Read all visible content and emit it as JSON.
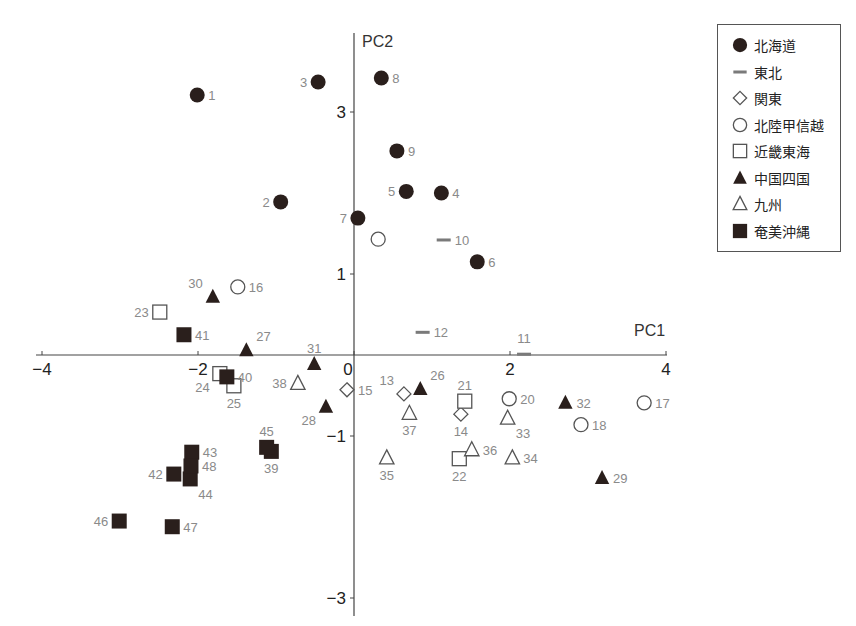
{
  "chart_data": {
    "type": "scatter",
    "title": "",
    "xlabel": "PC1",
    "ylabel": "PC2",
    "xlim": [
      -4,
      4
    ],
    "ylim": [
      -3.2,
      3.8
    ],
    "xticks": [
      -4,
      -2,
      0,
      2,
      4
    ],
    "yticks": [
      3,
      1,
      -1,
      -3
    ],
    "xtick_labels": [
      "−4",
      "−2",
      "0",
      "2",
      "4"
    ],
    "ytick_labels": [
      "3",
      "1",
      "−1",
      "−3"
    ],
    "grid": false,
    "legend_position": "upper right (outside)",
    "series": [
      {
        "name": "北海道",
        "marker": "filled-circle",
        "points": [
          {
            "id": "1",
            "x": -2.01,
            "y": 3.21,
            "label_pos": "right"
          },
          {
            "id": "2",
            "x": -0.94,
            "y": 1.89,
            "label_pos": "left"
          },
          {
            "id": "3",
            "x": -0.46,
            "y": 3.37,
            "label_pos": "left"
          },
          {
            "id": "4",
            "x": 1.12,
            "y": 2.0,
            "label_pos": "right"
          },
          {
            "id": "5",
            "x": 0.67,
            "y": 2.02,
            "label_pos": "left"
          },
          {
            "id": "6",
            "x": 1.58,
            "y": 1.15,
            "label_pos": "right"
          },
          {
            "id": "7",
            "x": 0.05,
            "y": 1.69,
            "label_pos": "left"
          },
          {
            "id": "8",
            "x": 0.35,
            "y": 3.42,
            "label_pos": "right"
          },
          {
            "id": "9",
            "x": 0.55,
            "y": 2.52,
            "label_pos": "right"
          }
        ]
      },
      {
        "name": "東北",
        "marker": "dash",
        "points": [
          {
            "id": "10",
            "x": 1.15,
            "y": 1.42,
            "label_pos": "right"
          },
          {
            "id": "11",
            "x": 2.18,
            "y": 0.01,
            "label_pos": "above"
          },
          {
            "id": "12",
            "x": 0.88,
            "y": 0.28,
            "label_pos": "right"
          }
        ]
      },
      {
        "name": "関東",
        "marker": "open-diamond",
        "points": [
          {
            "id": "13",
            "x": 0.64,
            "y": -0.48,
            "label_pos": "above-left"
          },
          {
            "id": "14",
            "x": 1.37,
            "y": -0.73,
            "label_pos": "below"
          },
          {
            "id": "15",
            "x": -0.09,
            "y": -0.43,
            "label_pos": "right"
          }
        ]
      },
      {
        "name": "北陸甲信越",
        "marker": "open-circle",
        "points": [
          {
            "id": "16",
            "x": -1.49,
            "y": 0.84,
            "label_pos": "right"
          },
          {
            "id": "17",
            "x": 3.72,
            "y": -0.59,
            "label_pos": "right"
          },
          {
            "id": "18",
            "x": 2.91,
            "y": -0.86,
            "label_pos": "right"
          },
          {
            "id": "19",
            "x": 0.31,
            "y": 1.43,
            "label_pos": "none"
          },
          {
            "id": "20",
            "x": 1.99,
            "y": -0.54,
            "label_pos": "right"
          }
        ]
      },
      {
        "name": "近畿東海",
        "marker": "open-square",
        "points": [
          {
            "id": "21",
            "x": 1.42,
            "y": -0.57,
            "label_pos": "above"
          },
          {
            "id": "22",
            "x": 1.35,
            "y": -1.28,
            "label_pos": "below"
          },
          {
            "id": "23",
            "x": -2.49,
            "y": 0.53,
            "label_pos": "left"
          },
          {
            "id": "24",
            "x": -1.72,
            "y": -0.23,
            "label_pos": "below-left"
          },
          {
            "id": "25",
            "x": -1.54,
            "y": -0.38,
            "label_pos": "below"
          }
        ]
      },
      {
        "name": "中国四国",
        "marker": "filled-triangle",
        "points": [
          {
            "id": "26",
            "x": 0.85,
            "y": -0.42,
            "label_pos": "above-right"
          },
          {
            "id": "27",
            "x": -1.38,
            "y": 0.06,
            "label_pos": "above-right"
          },
          {
            "id": "28",
            "x": -0.36,
            "y": -0.64,
            "label_pos": "below-left"
          },
          {
            "id": "29",
            "x": 3.18,
            "y": -1.52,
            "label_pos": "right"
          },
          {
            "id": "30",
            "x": -1.81,
            "y": 0.72,
            "label_pos": "above-left"
          },
          {
            "id": "31",
            "x": -0.51,
            "y": -0.11,
            "label_pos": "above"
          },
          {
            "id": "32",
            "x": 2.71,
            "y": -0.59,
            "label_pos": "right"
          }
        ]
      },
      {
        "name": "九州",
        "marker": "open-triangle",
        "points": [
          {
            "id": "33",
            "x": 1.97,
            "y": -0.78,
            "label_pos": "below-right"
          },
          {
            "id": "34",
            "x": 2.03,
            "y": -1.27,
            "label_pos": "right"
          },
          {
            "id": "35",
            "x": 0.42,
            "y": -1.27,
            "label_pos": "below"
          },
          {
            "id": "36",
            "x": 1.51,
            "y": -1.17,
            "label_pos": "right"
          },
          {
            "id": "37",
            "x": 0.71,
            "y": -0.72,
            "label_pos": "below"
          },
          {
            "id": "38",
            "x": -0.72,
            "y": -0.35,
            "label_pos": "left"
          }
        ]
      },
      {
        "name": "奄美沖縄",
        "marker": "filled-square",
        "points": [
          {
            "id": "39",
            "x": -1.06,
            "y": -1.19,
            "label_pos": "below"
          },
          {
            "id": "40",
            "x": -1.63,
            "y": -0.27,
            "label_pos": "right"
          },
          {
            "id": "41",
            "x": -2.18,
            "y": 0.25,
            "label_pos": "right"
          },
          {
            "id": "42",
            "x": -2.31,
            "y": -1.47,
            "label_pos": "left"
          },
          {
            "id": "43",
            "x": -2.08,
            "y": -1.2,
            "label_pos": "right"
          },
          {
            "id": "44",
            "x": -2.1,
            "y": -1.53,
            "label_pos": "below-right"
          },
          {
            "id": "45",
            "x": -1.12,
            "y": -1.14,
            "label_pos": "above"
          },
          {
            "id": "46",
            "x": -3.01,
            "y": -2.05,
            "label_pos": "left"
          },
          {
            "id": "47",
            "x": -2.33,
            "y": -2.12,
            "label_pos": "right"
          },
          {
            "id": "48",
            "x": -2.09,
            "y": -1.37,
            "label_pos": "right"
          }
        ]
      }
    ]
  },
  "legend": {
    "items": [
      {
        "label": "北海道",
        "marker": "filled-circle"
      },
      {
        "label": "東北",
        "marker": "dash"
      },
      {
        "label": "関東",
        "marker": "open-diamond"
      },
      {
        "label": "北陸甲信越",
        "marker": "open-circle"
      },
      {
        "label": "近畿東海",
        "marker": "open-square"
      },
      {
        "label": "中国四国",
        "marker": "filled-triangle"
      },
      {
        "label": "九州",
        "marker": "open-triangle"
      },
      {
        "label": "奄美沖縄",
        "marker": "filled-square"
      }
    ]
  },
  "colors": {
    "filled": "#2a1f1c",
    "outline": "#555555",
    "dash": "#7a7a7a",
    "axis": "#444444",
    "point_label": "#8a8a8a"
  }
}
